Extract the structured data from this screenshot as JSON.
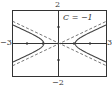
{
  "chart_data": {
    "type": "line",
    "title": "",
    "annotation": "C = −1",
    "xlabel": "",
    "ylabel": "",
    "xlim": [
      -3,
      3
    ],
    "ylim": [
      -2,
      2
    ],
    "tick_labels": {
      "x_min": "−3",
      "x_max": "3",
      "y_max": "2",
      "y_min": "−2"
    },
    "grid": false,
    "series": [
      {
        "name": "hyperbola",
        "style": "solid",
        "equation": "x^2 - y^2/0.16 = 1",
        "a": 1,
        "b": 0.4
      },
      {
        "name": "asymptotes",
        "style": "dashed",
        "slopes": [
          0.45,
          -0.45
        ]
      }
    ],
    "colors": {
      "curve": "#444444",
      "axes": "#333333",
      "frame": "#333333"
    }
  }
}
